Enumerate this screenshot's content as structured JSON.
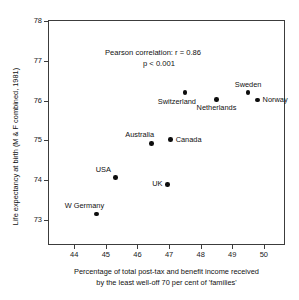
{
  "chart_data": {
    "type": "scatter",
    "title": "",
    "xlabel": "Percentage of total post-tax and benefit income received by the least well-off 70 per cent of 'families'",
    "xlabel_line1": "Percentage of total post-tax and benefit income received",
    "xlabel_line2": "by the least well-off 70 per cent of 'families'",
    "ylabel": "Life expectancy at birth (M & F combined, 1981)",
    "xlim": [
      43.2,
      50.7
    ],
    "ylim": [
      72.35,
      78.0
    ],
    "xticks": [
      44,
      45,
      46,
      47,
      48,
      49,
      50
    ],
    "yticks": [
      73,
      74,
      75,
      76,
      77,
      78
    ],
    "xtick_labels": [
      "44",
      "45",
      "46",
      "47",
      "48",
      "49",
      "50"
    ],
    "ytick_labels": [
      "73",
      "74",
      "75",
      "76",
      "77",
      "78"
    ],
    "grid": false,
    "legend": false,
    "annotations": [
      {
        "name": "pearson-correlation",
        "line1": "Pearson correlation:  r = 0.86",
        "line2": "p < 0.001"
      }
    ],
    "points": [
      {
        "label": "W Germany",
        "x": 44.7,
        "y": 73.15,
        "label_pos": "above-left"
      },
      {
        "label": "USA",
        "x": 45.3,
        "y": 74.07,
        "label_pos": "above-left"
      },
      {
        "label": "Australia",
        "x": 46.45,
        "y": 74.93,
        "label_pos": "above-left"
      },
      {
        "label": "UK",
        "x": 46.95,
        "y": 73.9,
        "label_pos": "left"
      },
      {
        "label": "Canada",
        "x": 47.05,
        "y": 75.02,
        "label_pos": "right"
      },
      {
        "label": "Switzerland",
        "x": 47.5,
        "y": 76.2,
        "label_pos": "below-left"
      },
      {
        "label": "Netherlands",
        "x": 48.5,
        "y": 76.03,
        "label_pos": "below"
      },
      {
        "label": "Sweden",
        "x": 49.5,
        "y": 76.2,
        "label_pos": "above"
      },
      {
        "label": "Norway",
        "x": 49.8,
        "y": 76.02,
        "label_pos": "right"
      }
    ],
    "colors": {
      "marker": "#0d0d0d",
      "axis": "#3c3c3c",
      "text": "#111111",
      "background": "#ffffff"
    }
  }
}
